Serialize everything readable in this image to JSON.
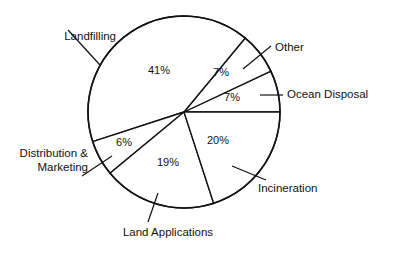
{
  "chart_data": {
    "type": "pie",
    "title": "",
    "subtitle": "",
    "xlabel": "",
    "ylabel": "",
    "legend_position": "none",
    "grid": false,
    "labels_outside": true,
    "total": 100,
    "categories": [
      "Ocean Disposal",
      "Other",
      "Landfilling",
      "Distribution & Marketing",
      "Land Applications",
      "Incineration"
    ],
    "values": [
      7,
      7,
      41,
      6,
      19,
      20
    ],
    "slices": [
      {
        "name": "ocean-disposal",
        "label": "Ocean Disposal",
        "value": 7,
        "value_text": "7%",
        "start_angle": 0,
        "end_angle": 25.2,
        "pct_label_x": 232,
        "pct_label_y": 98,
        "label_x": 287,
        "label_y": 95,
        "label_anchor": "start",
        "leader": [
          260,
          95,
          283,
          95
        ],
        "color": "#ffffff"
      },
      {
        "name": "other",
        "label": "Other",
        "value": 7,
        "value_text": "7%",
        "start_angle": 25.2,
        "end_angle": 50.4,
        "pct_label_x": 221,
        "pct_label_y": 73,
        "label_x": 275,
        "label_y": 48,
        "label_anchor": "start",
        "leader": [
          243,
          69,
          271,
          46
        ],
        "color": "#ffffff"
      },
      {
        "name": "landfilling",
        "label": "Landfilling",
        "value": 41,
        "value_text": "41%",
        "start_angle": 50.4,
        "end_angle": 198,
        "pct_label_x": 159,
        "pct_label_y": 71,
        "label_x": 116,
        "label_y": 37,
        "label_anchor": "end",
        "leader": [
          68,
          30,
          100,
          65
        ],
        "color": "#ffffff"
      },
      {
        "name": "distribution-marketing",
        "label": "Distribution &",
        "label2": "Marketing",
        "value": 6,
        "value_text": "6%",
        "start_angle": 198,
        "end_angle": 219.6,
        "pct_label_x": 124,
        "pct_label_y": 143,
        "label_x": 88,
        "label_y": 161,
        "label_anchor": "end",
        "leader": [
          82,
          176,
          112,
          156
        ],
        "color": "#ffffff"
      },
      {
        "name": "land-applications",
        "label": "Land Applications",
        "value": 19,
        "value_text": "19%",
        "start_angle": 219.6,
        "end_angle": 288,
        "pct_label_x": 168,
        "pct_label_y": 163,
        "label_x": 168,
        "label_y": 233,
        "label_anchor": "middle",
        "leader": [
          158,
          193,
          148,
          222
        ],
        "color": "#ffffff"
      },
      {
        "name": "incineration",
        "label": "Incineration",
        "value": 20,
        "value_text": "20%",
        "start_angle": 288,
        "end_angle": 360,
        "pct_label_x": 218,
        "pct_label_y": 141,
        "label_x": 258,
        "label_y": 189,
        "label_anchor": "start",
        "leader": [
          232,
          166,
          266,
          180
        ],
        "color": "#ffffff"
      }
    ],
    "geometry": {
      "center_x": 184,
      "center_y": 112,
      "radius": 96
    },
    "style": {
      "line_color": "#111111",
      "fill_color": "#ffffff",
      "background": "#ffffff"
    }
  }
}
